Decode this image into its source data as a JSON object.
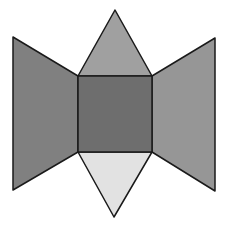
{
  "diagram": {
    "shapes": [
      {
        "id": "left-trapezoid",
        "points": "13,37 78,76 78,152 13,190",
        "fill": "#808080"
      },
      {
        "id": "right-trapezoid",
        "points": "152,76 215,38 215,191 152,152",
        "fill": "#969696"
      },
      {
        "id": "top-triangle",
        "points": "115,10 78,76 152,76",
        "fill": "#a0a0a0"
      },
      {
        "id": "bottom-triangle",
        "points": "78,152 152,152 114,217",
        "fill": "#e2e2e2"
      },
      {
        "id": "center-square",
        "points": "78,76 152,76 152,152 78,152",
        "fill": "#6e6e6e"
      }
    ],
    "stroke": "#1a1a1a"
  },
  "caption": {
    "text": ""
  }
}
